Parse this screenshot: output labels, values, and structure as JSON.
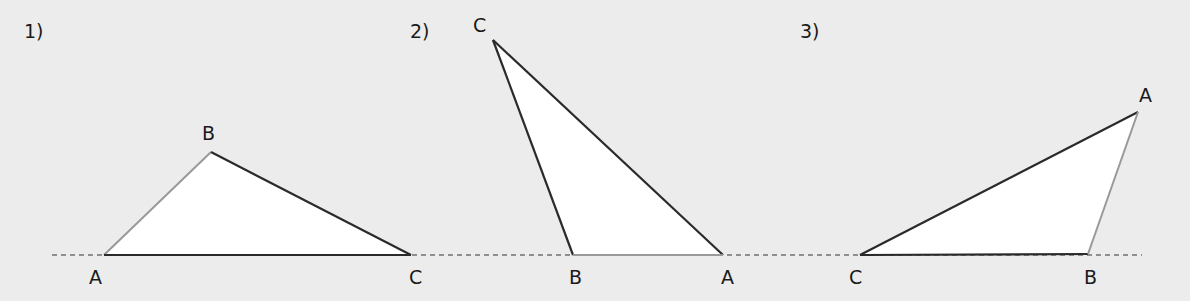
{
  "figures": [
    {
      "number": "1)",
      "vertices": {
        "A": {
          "label": "A",
          "x": 104,
          "y": 255
        },
        "B": {
          "label": "B",
          "x": 211,
          "y": 152
        },
        "C": {
          "label": "C",
          "x": 411,
          "y": 255
        }
      },
      "light_side": "AB"
    },
    {
      "number": "2)",
      "vertices": {
        "C": {
          "label": "C",
          "x": 493,
          "y": 40
        },
        "B": {
          "label": "B",
          "x": 573,
          "y": 255
        },
        "A": {
          "label": "A",
          "x": 723,
          "y": 255
        }
      },
      "light_side": "BA"
    },
    {
      "number": "3)",
      "vertices": {
        "C": {
          "label": "C",
          "x": 860,
          "y": 255
        },
        "B": {
          "label": "B",
          "x": 1088,
          "y": 254
        },
        "A": {
          "label": "A",
          "x": 1138,
          "y": 112
        }
      },
      "light_side": "BA"
    }
  ],
  "colors": {
    "background": "#ececec",
    "fill": "#ffffff",
    "dark_edge": "#2a2a2a",
    "light_edge": "#999999",
    "dashed_line": "#333333"
  }
}
